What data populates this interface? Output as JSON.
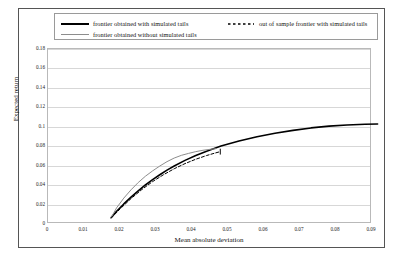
{
  "legend": {
    "entries": [
      {
        "label": "frontier obtained with simulated tails",
        "style": "solid",
        "color": "#000000"
      },
      {
        "label": "frontier obtained without simulated tails",
        "style": "solid",
        "color": "#8d8d8d"
      },
      {
        "label": "out of sample frontier with simulated tails",
        "style": "dashed",
        "color": "#000000"
      }
    ]
  },
  "axes": {
    "x_title": "Mean absolute deviation",
    "y_title": "Expected return"
  },
  "chart_data": {
    "type": "line",
    "title": "",
    "xlabel": "Mean absolute deviation",
    "ylabel": "Expected return",
    "xlim": [
      0,
      0.09
    ],
    "ylim": [
      0,
      0.18
    ],
    "xticks": [
      0,
      0.01,
      0.02,
      0.03,
      0.04,
      0.05,
      0.06,
      0.07,
      0.08,
      0.09
    ],
    "xtick_labels": [
      "0",
      "0.01",
      "0.02",
      "0.03",
      "0.04",
      "0.05",
      "0.06",
      "0.07",
      "0.08",
      "0.09"
    ],
    "yticks": [
      0,
      0.02,
      0.04,
      0.06,
      0.08,
      0.1,
      0.12,
      0.14,
      0.16,
      0.18
    ],
    "ytick_labels": [
      "0",
      "0.02",
      "0.04",
      "0.06",
      "0.08",
      "0.1",
      "0.12",
      "0.14",
      "0.16",
      "0.18"
    ],
    "grid": "horizontal",
    "legend_position": "top",
    "series": [
      {
        "name": "frontier obtained with simulated tails",
        "style": "solid",
        "color": "#000000",
        "width": 1.6,
        "points": [
          [
            0.0045,
            0.056
          ],
          [
            0.006,
            0.0625
          ],
          [
            0.008,
            0.07
          ],
          [
            0.01,
            0.077
          ],
          [
            0.012,
            0.0835
          ],
          [
            0.014,
            0.0895
          ],
          [
            0.016,
            0.095
          ],
          [
            0.018,
            0.1
          ],
          [
            0.02,
            0.1048
          ],
          [
            0.022,
            0.109
          ],
          [
            0.025,
            0.1148
          ],
          [
            0.028,
            0.1198
          ],
          [
            0.031,
            0.1243
          ],
          [
            0.035,
            0.1295
          ],
          [
            0.04,
            0.1348
          ],
          [
            0.045,
            0.1392
          ],
          [
            0.05,
            0.1428
          ],
          [
            0.055,
            0.1457
          ],
          [
            0.06,
            0.1482
          ],
          [
            0.065,
            0.15
          ],
          [
            0.07,
            0.1512
          ],
          [
            0.075,
            0.1519
          ],
          [
            0.0785,
            0.1522
          ]
        ]
      },
      {
        "name": "frontier obtained without simulated tails",
        "style": "solid",
        "color": "#8d8d8d",
        "width": 1.0,
        "points": [
          [
            0.0045,
            0.056
          ],
          [
            0.006,
            0.066
          ],
          [
            0.008,
            0.076
          ],
          [
            0.01,
            0.0845
          ],
          [
            0.012,
            0.092
          ],
          [
            0.014,
            0.0985
          ],
          [
            0.016,
            0.104
          ],
          [
            0.018,
            0.109
          ],
          [
            0.02,
            0.1135
          ],
          [
            0.022,
            0.1172
          ],
          [
            0.024,
            0.12
          ],
          [
            0.026,
            0.122
          ],
          [
            0.028,
            0.1238
          ],
          [
            0.03,
            0.1252
          ],
          [
            0.032,
            0.1262
          ],
          [
            0.0335,
            0.1268
          ]
        ]
      },
      {
        "name": "out of sample frontier with simulated tails",
        "style": "dashed",
        "color": "#000000",
        "width": 1.0,
        "points": [
          [
            0.0045,
            0.0555
          ],
          [
            0.007,
            0.065
          ],
          [
            0.01,
            0.0755
          ],
          [
            0.013,
            0.0848
          ],
          [
            0.016,
            0.093
          ],
          [
            0.019,
            0.1
          ],
          [
            0.022,
            0.1062
          ],
          [
            0.025,
            0.1115
          ],
          [
            0.028,
            0.116
          ],
          [
            0.031,
            0.1198
          ],
          [
            0.0335,
            0.1225
          ],
          [
            0.0348,
            0.1238
          ]
        ],
        "end_marker": {
          "x": 0.0348,
          "y_low": 0.1208,
          "y_high": 0.1268
        }
      }
    ]
  }
}
